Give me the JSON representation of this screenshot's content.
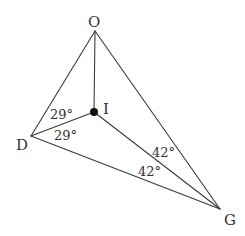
{
  "diagram": {
    "type": "geometry-triangle-incenter",
    "colors": {
      "stroke": "#3a3a3a",
      "text": "#333333",
      "point": "#111111",
      "background": "#ffffff"
    },
    "points": {
      "O": {
        "label": "O",
        "x": 95,
        "y": 31
      },
      "I": {
        "label": "I",
        "x": 94,
        "y": 112
      },
      "D": {
        "label": "D",
        "x": 31,
        "y": 136
      },
      "G": {
        "label": "G",
        "x": 220,
        "y": 209
      }
    },
    "segments": [
      {
        "from": "O",
        "to": "D"
      },
      {
        "from": "O",
        "to": "G"
      },
      {
        "from": "D",
        "to": "G"
      },
      {
        "from": "O",
        "to": "I"
      },
      {
        "from": "D",
        "to": "I"
      },
      {
        "from": "G",
        "to": "I"
      }
    ],
    "angles": {
      "odi": {
        "label": "29°",
        "vertex": "D"
      },
      "idg": {
        "label": "29°",
        "vertex": "D"
      },
      "ogi": {
        "label": "42°",
        "vertex": "G"
      },
      "igd": {
        "label": "42°",
        "vertex": "G"
      }
    }
  }
}
